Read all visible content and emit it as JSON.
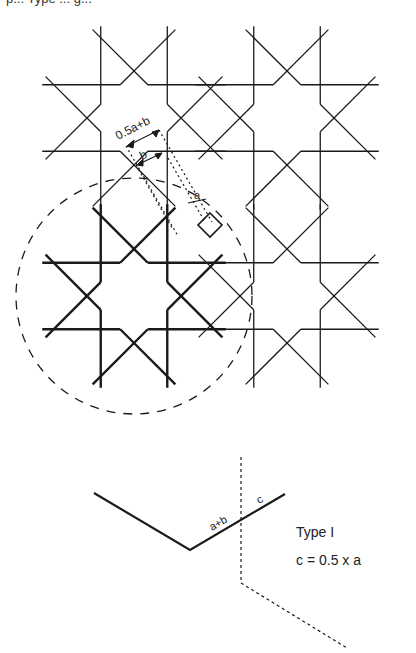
{
  "caption_cropped": "p... Type ... g...",
  "pattern": {
    "description": "Four tiled eight-pointed star rosettes; lower-left rosette emphasized in bold within a dashed circle",
    "stroke_color": "#1a1a1a",
    "rosettes": [
      {
        "name": "top-left",
        "cx": 134,
        "cy": 118,
        "bold": false
      },
      {
        "name": "top-right",
        "cx": 287,
        "cy": 118,
        "bold": false
      },
      {
        "name": "bottom-left",
        "cx": 134,
        "cy": 296,
        "bold": true
      },
      {
        "name": "bottom-right",
        "cx": 287,
        "cy": 296,
        "bold": false
      }
    ]
  },
  "dimensions": {
    "label_outer": "0.5a+b",
    "label_inner": "b",
    "label_small": "a"
  },
  "detail": {
    "segment_label_long": "a+b",
    "segment_label_short": "c",
    "type_label": "Type I",
    "formula": "c = 0.5 x a"
  }
}
